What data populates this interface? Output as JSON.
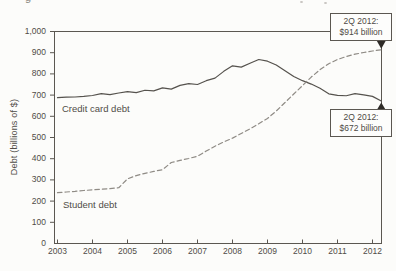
{
  "page": {
    "background": "#fcfcfa"
  },
  "artifacts": {
    "caption_fragment": "g"
  },
  "chart_data": {
    "type": "line",
    "title": "",
    "xlabel": "",
    "ylabel": "Debt (billions of $)",
    "ylim": [
      0,
      1000
    ],
    "grid": false,
    "frame": "full-box",
    "frame_color": "#5b5751",
    "marker_color": "#2e2b27",
    "x_ticks": [
      2003,
      2004,
      2005,
      2006,
      2007,
      2008,
      2009,
      2010,
      2011,
      2012
    ],
    "x_tick_labels": [
      "2003",
      "2004",
      "2005",
      "2006",
      "2007",
      "2008",
      "2009",
      "2010",
      "2011",
      "2012"
    ],
    "y_ticks": [
      0,
      100,
      200,
      300,
      400,
      500,
      600,
      700,
      800,
      900,
      1000
    ],
    "y_tick_labels": [
      "0",
      "100",
      "200",
      "300",
      "400",
      "500",
      "600",
      "700",
      "800",
      "900",
      "1,000"
    ],
    "series": [
      {
        "name": "Credit card debt",
        "style": "solid",
        "color": "#55524d",
        "label_position": "inside-left-upper",
        "x": [
          2003,
          2003.25,
          2003.5,
          2003.75,
          2004,
          2004.25,
          2004.5,
          2004.75,
          2005,
          2005.25,
          2005.5,
          2005.75,
          2006,
          2006.25,
          2006.5,
          2006.75,
          2007,
          2007.25,
          2007.5,
          2007.75,
          2008,
          2008.25,
          2008.5,
          2008.75,
          2009,
          2009.25,
          2009.5,
          2009.75,
          2010,
          2010.25,
          2010.5,
          2010.75,
          2011,
          2011.25,
          2011.5,
          2011.75,
          2012,
          2012.25
        ],
        "values": [
          688,
          690,
          691,
          694,
          698,
          707,
          702,
          710,
          716,
          712,
          723,
          720,
          734,
          728,
          746,
          754,
          750,
          768,
          780,
          812,
          838,
          832,
          850,
          868,
          860,
          842,
          815,
          788,
          768,
          752,
          732,
          706,
          699,
          697,
          707,
          701,
          694,
          672
        ]
      },
      {
        "name": "Student debt",
        "style": "dashed",
        "color": "#8f8b85",
        "label_position": "inside-left-lower",
        "x": [
          2003,
          2003.25,
          2003.5,
          2003.75,
          2004,
          2004.25,
          2004.5,
          2004.75,
          2005,
          2005.25,
          2005.5,
          2005.75,
          2006,
          2006.25,
          2006.5,
          2006.75,
          2007,
          2007.25,
          2007.5,
          2007.75,
          2008,
          2008.25,
          2008.5,
          2008.75,
          2009,
          2009.25,
          2009.5,
          2009.75,
          2010,
          2010.25,
          2010.5,
          2010.75,
          2011,
          2011.25,
          2011.5,
          2011.75,
          2012,
          2012.25
        ],
        "values": [
          240,
          243,
          246,
          250,
          253,
          256,
          259,
          263,
          305,
          320,
          331,
          340,
          348,
          382,
          392,
          401,
          412,
          436,
          459,
          479,
          497,
          519,
          541,
          565,
          590,
          625,
          665,
          705,
          745,
          785,
          820,
          848,
          868,
          882,
          893,
          901,
          908,
          914
        ]
      }
    ],
    "annotations": [
      {
        "line1": "2Q 2012:",
        "line2": "$914 billion",
        "series": "Student debt",
        "marker": "down",
        "value": 914
      },
      {
        "line1": "2Q 2012:",
        "line2": "$672 billion",
        "series": "Credit card debt",
        "marker": "up",
        "value": 672
      }
    ]
  }
}
